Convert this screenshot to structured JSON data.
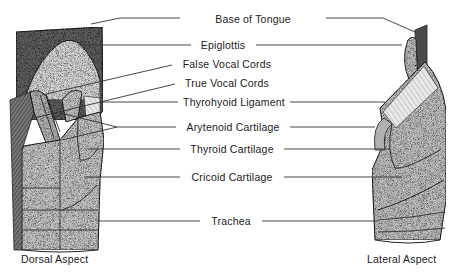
{
  "diagram": {
    "type": "anatomical-illustration",
    "labels": [
      {
        "id": "base-of-tongue",
        "text": "Base of Tongue",
        "x": 253,
        "y": 20
      },
      {
        "id": "epiglottis",
        "text": "Epiglottis",
        "x": 220,
        "y": 46
      },
      {
        "id": "false-vocal-cords",
        "text": "False Vocal Cords",
        "x": 223,
        "y": 65
      },
      {
        "id": "true-vocal-cords",
        "text": "True Vocal Cords",
        "x": 223,
        "y": 84
      },
      {
        "id": "thyrohyoid-ligament",
        "text": "Thyrohyoid Ligament",
        "x": 231,
        "y": 102
      },
      {
        "id": "arytenoid-cartilage",
        "text": "Arytenoid Cartilage",
        "x": 231,
        "y": 127
      },
      {
        "id": "thyroid-cartilage",
        "text": "Thyroid Cartilage",
        "x": 231,
        "y": 150
      },
      {
        "id": "cricoid-cartilage",
        "text": "Cricoid Cartilage",
        "x": 231,
        "y": 177
      },
      {
        "id": "trachea",
        "text": "Trachea",
        "x": 231,
        "y": 221
      }
    ],
    "captions": {
      "left": "Dorsal Aspect",
      "right": "Lateral Aspect"
    },
    "views": [
      "Dorsal Aspect",
      "Lateral Aspect"
    ]
  },
  "colors": {
    "ink": "#1a1a1a",
    "tissue_light": "#c9c9c9",
    "tissue_mid": "#a8a8a8",
    "tissue_dark": "#6e6e6e",
    "tongue_dark": "#555555",
    "background": "#ffffff"
  }
}
